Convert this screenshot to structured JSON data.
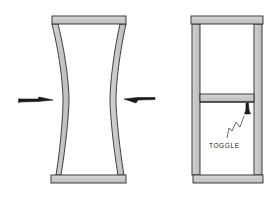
{
  "diagram": {
    "panels": [
      {
        "id": "left",
        "description": "Frame with sides bowed inward under lateral load",
        "arrows": [
          "left-pointing-right",
          "right-pointing-left"
        ]
      },
      {
        "id": "right",
        "description": "Frame braced with horizontal cross member",
        "labels": [
          {
            "text": "TOGGLE"
          }
        ]
      }
    ],
    "colors": {
      "stroke": "#2a2a2a",
      "fill": "#c9c9c9",
      "background": "#ffffff"
    }
  }
}
